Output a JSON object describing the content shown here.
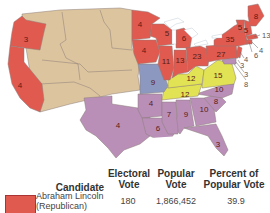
{
  "colors": {
    "republican": "#e05a50",
    "southern_democrat": "#b98fb8",
    "northern_democrat": "#8c98bf",
    "constitutional_union": "#e2e255",
    "territory": "#dcc49e",
    "water": "#ffffff"
  },
  "map": {
    "states": [
      {
        "id": "oregon",
        "label": "3",
        "party": "republican"
      },
      {
        "id": "california",
        "label": "4",
        "party": "republican"
      },
      {
        "id": "texas",
        "label": "4",
        "party": "southern_democrat"
      },
      {
        "id": "minnesota",
        "label": "4",
        "party": "republican"
      },
      {
        "id": "iowa",
        "label": "4",
        "party": "republican"
      },
      {
        "id": "wisconsin",
        "label": "5",
        "party": "republican"
      },
      {
        "id": "michigan",
        "label": "6",
        "party": "republican"
      },
      {
        "id": "illinois",
        "label": "11",
        "party": "republican"
      },
      {
        "id": "indiana",
        "label": "13",
        "party": "republican"
      },
      {
        "id": "ohio",
        "label": "23",
        "party": "republican"
      },
      {
        "id": "pennsylvania",
        "label": "27",
        "party": "republican"
      },
      {
        "id": "new-york",
        "label": "35",
        "party": "republican"
      },
      {
        "id": "vermont",
        "label": "5",
        "party": "republican"
      },
      {
        "id": "new-hampshire",
        "label": "5",
        "party": "republican"
      },
      {
        "id": "maine",
        "label": "8",
        "party": "republican"
      },
      {
        "id": "missouri",
        "label": "9",
        "party": "northern_democrat"
      },
      {
        "id": "kentucky",
        "label": "12",
        "party": "constitutional_union"
      },
      {
        "id": "tennessee",
        "label": "12",
        "party": "constitutional_union"
      },
      {
        "id": "virginia",
        "label": "15",
        "party": "constitutional_union"
      },
      {
        "id": "north-carolina",
        "label": "10",
        "party": "southern_democrat"
      },
      {
        "id": "south-carolina",
        "label": "8",
        "party": "southern_democrat"
      },
      {
        "id": "georgia",
        "label": "10",
        "party": "southern_democrat"
      },
      {
        "id": "alabama",
        "label": "9",
        "party": "southern_democrat"
      },
      {
        "id": "mississippi",
        "label": "7",
        "party": "southern_democrat"
      },
      {
        "id": "louisiana",
        "label": "6",
        "party": "southern_democrat"
      },
      {
        "id": "arkansas",
        "label": "4",
        "party": "southern_democrat"
      },
      {
        "id": "florida",
        "label": "3",
        "party": "southern_democrat"
      }
    ],
    "callouts": [
      {
        "id": "massachusetts",
        "label": "13",
        "party": "republican"
      },
      {
        "id": "rhode-island",
        "label": "4",
        "party": "republican"
      },
      {
        "id": "connecticut",
        "label": "6",
        "party": "republican"
      },
      {
        "id": "new-jersey",
        "label": "4",
        "party": "republican"
      },
      {
        "id": "delaware",
        "label": "3",
        "party": "southern_democrat"
      },
      {
        "id": "maryland-a",
        "label": "3",
        "party": "southern_democrat"
      },
      {
        "id": "maryland",
        "label": "8",
        "party": "southern_democrat"
      }
    ]
  },
  "table": {
    "headers": {
      "candidate": "Candidate",
      "electoral_vote": "Electoral Vote",
      "popular_vote": "Popular Vote",
      "percent": "Percent of Popular Vote"
    },
    "rows": [
      {
        "name": "Abraham Lincoln",
        "party": "(Republican)",
        "electoral_vote": "180",
        "popular_vote": "1,866,452",
        "percent": "39.9"
      }
    ]
  }
}
